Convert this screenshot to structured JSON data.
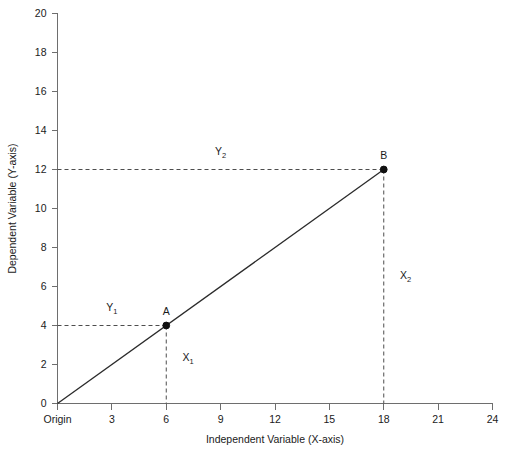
{
  "chart_data": {
    "type": "line",
    "title": "",
    "xlabel": "Independent Variable (X-axis)",
    "ylabel": "Dependent Variable (Y-axis)",
    "xlim": [
      0,
      24
    ],
    "ylim": [
      0,
      20
    ],
    "grid": false,
    "legend": "none",
    "x_ticks": [
      0,
      3,
      6,
      9,
      12,
      15,
      18,
      21,
      24
    ],
    "x_tick_labels": [
      "Origin",
      "3",
      "6",
      "9",
      "12",
      "15",
      "18",
      "21",
      "24"
    ],
    "y_ticks": [
      0,
      2,
      4,
      6,
      8,
      10,
      12,
      14,
      16,
      18,
      20
    ],
    "y_tick_labels": [
      "0",
      "2",
      "4",
      "6",
      "8",
      "10",
      "12",
      "14",
      "16",
      "18",
      "20"
    ],
    "series": [
      {
        "name": "line",
        "x": [
          0,
          18
        ],
        "y": [
          0,
          12
        ]
      }
    ],
    "points": [
      {
        "label": "A",
        "x": 6,
        "y": 4
      },
      {
        "label": "B",
        "x": 18,
        "y": 12
      }
    ],
    "annotations": [
      {
        "name": "Y1",
        "base": "Y",
        "sub": "1",
        "x": 3.0,
        "y": 4.75
      },
      {
        "name": "Y2",
        "base": "Y",
        "sub": "2",
        "x": 9.0,
        "y": 12.75
      },
      {
        "name": "X1",
        "base": "X",
        "sub": "1",
        "x": 7.2,
        "y": 2.2
      },
      {
        "name": "X2",
        "base": "X",
        "sub": "2",
        "x": 19.2,
        "y": 6.4
      }
    ],
    "guides": [
      {
        "name": "y1-horizontal",
        "from": [
          0,
          4
        ],
        "to": [
          6,
          4
        ]
      },
      {
        "name": "x1-vertical",
        "from": [
          6,
          4
        ],
        "to": [
          6,
          0
        ]
      },
      {
        "name": "y2-horizontal",
        "from": [
          0,
          12
        ],
        "to": [
          18,
          12
        ]
      },
      {
        "name": "x2-vertical",
        "from": [
          18,
          12
        ],
        "to": [
          18,
          0
        ]
      }
    ],
    "colors": {
      "line": "#2b2b2b",
      "axis": "#6e6e6e",
      "guide": "#4d4d4d",
      "marker": "#111111",
      "text": "#1a1a1a",
      "background": "#ffffff"
    }
  }
}
